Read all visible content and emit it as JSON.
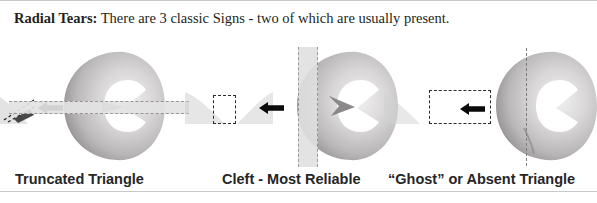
{
  "figure": {
    "background_color": "#ffffff",
    "border_color": "#c9c9c9"
  },
  "header": {
    "lead_label": "Radial Tears:",
    "body_text": " There are 3 classic Signs - two of which are usually present."
  },
  "panels": [
    {
      "id": "truncated-triangle",
      "caption": "Truncated Triangle",
      "overlay_type": "horizontal-dashed-band",
      "inset_type": "truncated-triangle-wedge",
      "arrow": "left-arrow",
      "meniscus_color_light": "#eceaea",
      "meniscus_color_mid": "#c6c4c4",
      "meniscus_color_dark": "#9a9898",
      "band_color": "#e3e3e3",
      "band_dash_color": "#8f8f8f"
    },
    {
      "id": "cleft-most-reliable",
      "caption": "Cleft - Most Reliable",
      "overlay_type": "vertical-dashed-band",
      "inset_type": "dashed-square-box",
      "arrow": "left-arrow",
      "meniscus_color_light": "#eceaea",
      "meniscus_color_mid": "#c6c4c4",
      "meniscus_color_dark": "#9a9898",
      "band_color": "#e0e0e0",
      "band_dash_color": "#8f8f8f"
    },
    {
      "id": "ghost-or-absent-triangle",
      "caption": "“Ghost” or Absent Triangle",
      "overlay_type": "vertical-dashed-line",
      "inset_type": "dashed-rectangle-box",
      "arrow": "left-arrow",
      "meniscus_color_light": "#eceaea",
      "meniscus_color_mid": "#c6c4c4",
      "meniscus_color_dark": "#9a9898",
      "band_color": "none",
      "band_dash_color": "#7d7d7d"
    }
  ],
  "captions": {
    "panel_1": "Truncated Triangle",
    "panel_2": "Cleft - Most Reliable",
    "panel_3": "“Ghost” or Absent Triangle"
  },
  "colors": {
    "text": "#231f20",
    "caption_text": "#262626",
    "arrow": "#0a0a0a",
    "dashed_box": "#2b2b2b",
    "rule": "#c9c9c9"
  }
}
